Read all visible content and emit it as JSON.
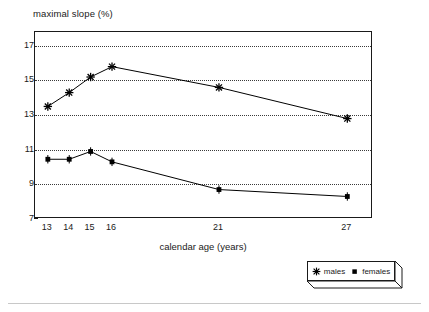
{
  "chart_data": {
    "type": "line",
    "title": "",
    "ylabel": "maximal slope (%)",
    "xlabel": "calendar age (years)",
    "x": [
      13,
      14,
      15,
      16,
      21,
      27
    ],
    "categories": [
      "13",
      "14",
      "15",
      "16",
      "21",
      "27"
    ],
    "xtick_labels": [
      "13",
      "14",
      "15",
      "16",
      "21",
      "27"
    ],
    "ytick_labels": [
      "17",
      "15",
      "13",
      "11",
      "9",
      "7"
    ],
    "yticks": [
      17,
      15,
      13,
      11,
      9,
      7
    ],
    "ylim": [
      7,
      17.8
    ],
    "xlim": [
      12.4,
      28.2
    ],
    "grid": "horizontal-dotted",
    "legend_position": "outside-bottom-right",
    "series": [
      {
        "name": "males",
        "marker": "asterisk",
        "values": [
          13.5,
          14.3,
          15.2,
          15.8,
          14.6,
          12.8
        ]
      },
      {
        "name": "females",
        "marker": "square",
        "values": [
          10.45,
          10.45,
          10.9,
          10.3,
          8.7,
          8.3
        ]
      }
    ]
  },
  "legend": {
    "items": [
      {
        "label": "males",
        "marker": "asterisk-marker-icon"
      },
      {
        "label": "females",
        "marker": "square-marker-icon"
      }
    ]
  },
  "colors": {
    "ink": "#1a1a1a",
    "grid": "#3a3a3a",
    "background": "#ffffff",
    "rule": "#c8c8c8"
  }
}
